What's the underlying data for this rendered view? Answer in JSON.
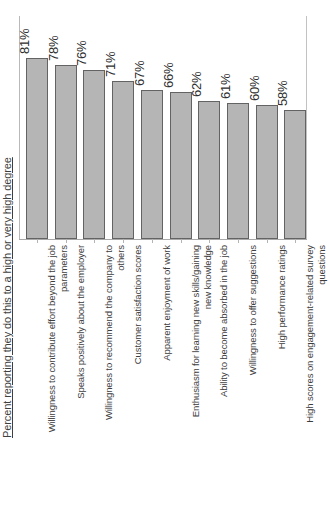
{
  "chart_data": {
    "type": "bar",
    "title": "",
    "subtitle": "",
    "xlabel": "",
    "ylabel": "Percent reporting they do this to a high or very high degree",
    "ylim": [
      0,
      100
    ],
    "grid": false,
    "legend": false,
    "orientation": "vertical",
    "value_label_suffix": "%",
    "bar_color": "#b5b5b5",
    "bar_border_color": "#636363",
    "background_color": "#ffffff",
    "categories": [
      "Willingness to contribute effort beyond the job\nparameters",
      "Speaks positively about the employer",
      "Willingness to recommend the company to\nothers",
      "Customer satisfaction scores",
      "Apparent enjoyment of work",
      "Enthusiasm for learning new skills/gaining\nnew knowledge",
      "Ability to become absorbed in the job",
      "Willingness to offer suggestions",
      "High performance ratings",
      "High scores on engagement-related survey\nquestions"
    ],
    "values": [
      81,
      78,
      76,
      71,
      67,
      66,
      62,
      61,
      60,
      58
    ],
    "value_labels": [
      "81%",
      "78%",
      "76%",
      "71%",
      "67%",
      "66%",
      "62%",
      "61%",
      "60%",
      "58%"
    ]
  }
}
